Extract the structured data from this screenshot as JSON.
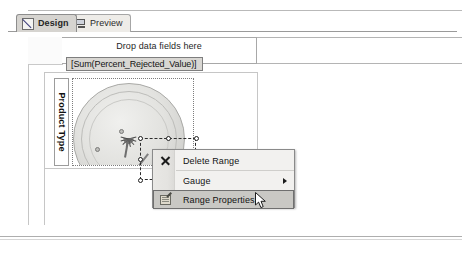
{
  "window": {
    "tabs": [
      {
        "label": "Design",
        "icon": "design-icon",
        "active": true
      },
      {
        "label": "Preview",
        "icon": "monitor-icon",
        "active": false
      }
    ]
  },
  "designer": {
    "drop_zone_label": "Drop data fields here",
    "data_field_chip": "[Sum(Percent_Rejected_Value)]",
    "row_group_label": "Product Type",
    "gauge": {
      "name": "radial-gauge",
      "selected": true,
      "handle_count": 8
    }
  },
  "context_menu": {
    "items": [
      {
        "label": "Delete Range",
        "icon": "close-x-icon",
        "has_submenu": false,
        "highlighted": false
      },
      {
        "label": "Gauge",
        "icon": "none",
        "has_submenu": true,
        "highlighted": false
      },
      {
        "label": "Range Properties...",
        "icon": "properties-icon",
        "has_submenu": false,
        "highlighted": true
      }
    ]
  },
  "colors": {
    "menu_background": "#f2f1ef",
    "menu_highlight": "#c9c8c4",
    "menu_border": "#8a8a8a",
    "active_tab": "#d6d4d0",
    "inactive_tab": "#eeece8",
    "chip_background": "#d9d7d3",
    "gauge_arc": "#a8aea0"
  }
}
